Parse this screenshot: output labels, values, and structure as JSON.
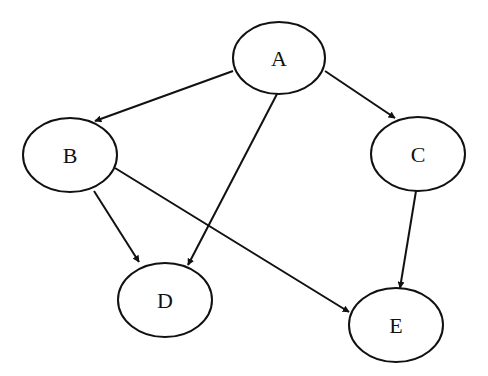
{
  "diagram": {
    "type": "directed-graph",
    "nodes": [
      {
        "id": "A",
        "label": "A",
        "cx": 279,
        "cy": 58,
        "rx": 46,
        "ry": 36
      },
      {
        "id": "B",
        "label": "B",
        "cx": 70,
        "cy": 155,
        "rx": 47,
        "ry": 37
      },
      {
        "id": "C",
        "label": "C",
        "cx": 418,
        "cy": 154,
        "rx": 47,
        "ry": 37
      },
      {
        "id": "D",
        "label": "D",
        "cx": 165,
        "cy": 300,
        "rx": 47,
        "ry": 37
      },
      {
        "id": "E",
        "label": "E",
        "cx": 396,
        "cy": 325,
        "rx": 47,
        "ry": 37
      }
    ],
    "edges": [
      {
        "from": "A",
        "to": "B",
        "x1": 233,
        "y1": 71,
        "x2": 95,
        "y2": 121
      },
      {
        "from": "A",
        "to": "C",
        "x1": 325,
        "y1": 71,
        "x2": 395,
        "y2": 118
      },
      {
        "from": "A",
        "to": "D",
        "x1": 277,
        "y1": 94,
        "x2": 188,
        "y2": 265
      },
      {
        "from": "B",
        "to": "D",
        "x1": 94,
        "y1": 191,
        "x2": 139,
        "y2": 262
      },
      {
        "from": "B",
        "to": "E",
        "x1": 115,
        "y1": 168,
        "x2": 349,
        "y2": 312
      },
      {
        "from": "C",
        "to": "E",
        "x1": 416,
        "y1": 191,
        "x2": 400,
        "y2": 288
      }
    ]
  }
}
